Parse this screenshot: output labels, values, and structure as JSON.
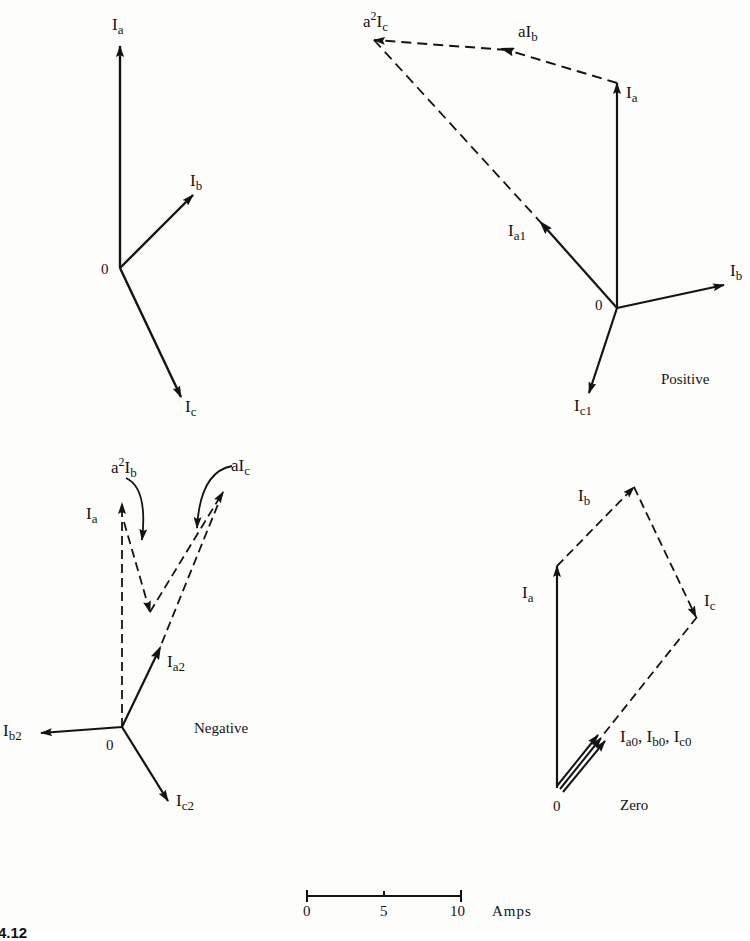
{
  "diagram": {
    "caption": "4.12",
    "panels": {
      "original": {
        "origin_label": "0",
        "vectors": [
          {
            "name": "Ia",
            "base": "I",
            "sub": "a"
          },
          {
            "name": "Ib",
            "base": "I",
            "sub": "b"
          },
          {
            "name": "Ic",
            "base": "I",
            "sub": "c"
          }
        ]
      },
      "positive": {
        "title": "Positive",
        "origin_label": "0",
        "labels": {
          "Ia": {
            "base": "I",
            "sub": "a"
          },
          "Ib": {
            "base": "I",
            "sub": "b"
          },
          "Ia1": {
            "base": "I",
            "sub": "a1"
          },
          "Ic1": {
            "base": "I",
            "sub": "c1"
          },
          "aIb": {
            "pre": "a",
            "base": "I",
            "sub": "b"
          },
          "a2Ic": {
            "pre": "a",
            "sup": "2",
            "base": "I",
            "sub": "c"
          }
        }
      },
      "negative": {
        "title": "Negative",
        "origin_label": "0",
        "labels": {
          "Ia": {
            "base": "I",
            "sub": "a"
          },
          "Ia2": {
            "base": "I",
            "sub": "a2"
          },
          "Ib2": {
            "base": "I",
            "sub": "b2"
          },
          "Ic2": {
            "base": "I",
            "sub": "c2"
          },
          "a2Ib": {
            "pre": "a",
            "sup": "2",
            "base": "I",
            "sub": "b"
          },
          "aIc": {
            "pre": "a",
            "base": "I",
            "sub": "c"
          }
        }
      },
      "zero": {
        "title": "Zero",
        "origin_label": "0",
        "labels": {
          "Ia": {
            "base": "I",
            "sub": "a"
          },
          "Ib": {
            "base": "I",
            "sub": "b"
          },
          "Ic": {
            "base": "I",
            "sub": "c"
          },
          "I0": {
            "a_base": "I",
            "a_sub": "a0",
            "sep": ", ",
            "b_base": "I",
            "b_sub": "b0",
            "c_base": "I",
            "c_sub": "c0"
          }
        }
      }
    },
    "scale_bar": {
      "ticks": [
        "0",
        "5",
        "10"
      ],
      "unit": "Amps"
    },
    "colors": {
      "ink": "#141414",
      "paper": "#fdfdfb"
    }
  }
}
